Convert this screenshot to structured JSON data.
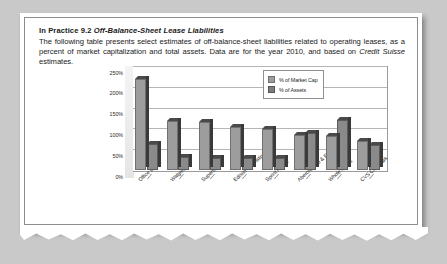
{
  "box": {
    "heading_prefix": "In Practice 9.2 ",
    "heading_title": "Off-Balance-Sheet Lease Liabilities",
    "body_part1": "The following table presents select estimates of off-balance-sheet liabilities related to operating leases, as a percent of market capitalization and total assets. Data are for the year 2010, and based on ",
    "body_italic": "Credit Suisse",
    "body_part2": " estimates."
  },
  "chart_data": {
    "type": "bar",
    "title": "",
    "xlabel": "",
    "ylabel": "",
    "ylim": [
      0,
      250
    ],
    "ytick_labels": [
      "250%",
      "200%",
      "150%",
      "100%",
      "50%",
      "0%"
    ],
    "ytick_values": [
      250,
      200,
      150,
      100,
      50,
      0
    ],
    "grid": true,
    "legend_position": "top-right",
    "categories": [
      "Office Depot",
      "Walgreen",
      "Supervalu",
      "Edison International",
      "Sprint Nextel",
      "Abercrombie & Fitch",
      "Whole Foods",
      "CVS Caremark"
    ],
    "series": [
      {
        "name": "% of Market Cap",
        "color": "#9d9d9d",
        "values": [
          218,
          118,
          115,
          103,
          98,
          85,
          82,
          70
        ]
      },
      {
        "name": "% of Assets",
        "color": "#7d7d7d",
        "values": [
          62,
          32,
          28,
          30,
          28,
          88,
          120,
          60
        ]
      }
    ]
  }
}
